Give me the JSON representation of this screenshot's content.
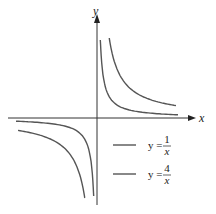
{
  "chart_data": {
    "type": "line",
    "title": "",
    "xlabel": "x",
    "ylabel": "y",
    "grid": false,
    "legend_position": "lower-right",
    "series": [
      {
        "name": "y = 1/x",
        "numerator": "1",
        "denominator": "x",
        "function": "1/x"
      },
      {
        "name": "y = 4/x",
        "numerator": "4",
        "denominator": "x",
        "function": "4/x"
      }
    ]
  },
  "axes": {
    "x_label": "x",
    "y_label": "y"
  },
  "legend": [
    {
      "lhs": "y =",
      "num": "1",
      "den": "x"
    },
    {
      "lhs": "y =",
      "num": "4",
      "den": "x"
    }
  ],
  "colors": {
    "curve": "#555555",
    "axis": "#333333"
  }
}
